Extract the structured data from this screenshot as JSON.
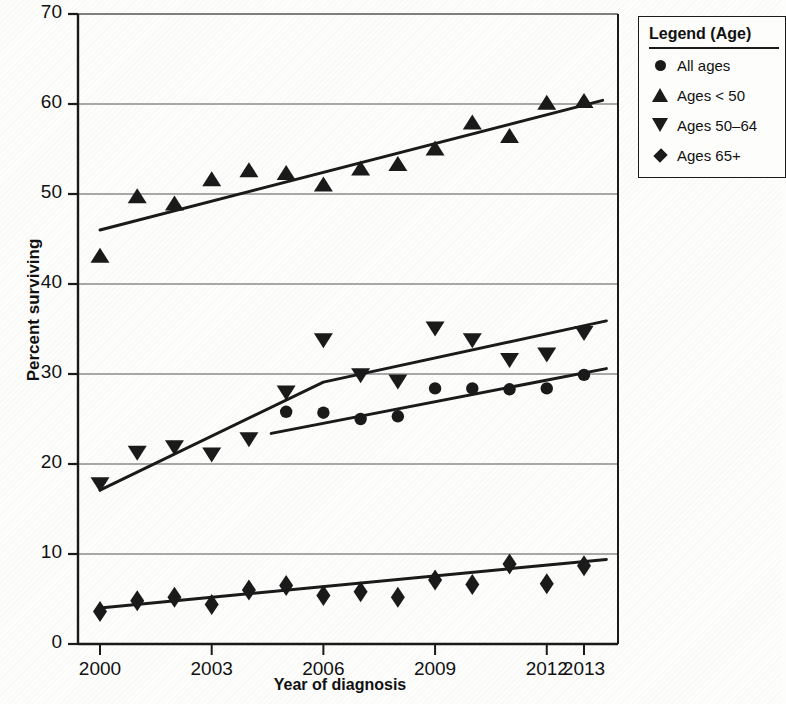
{
  "chart_data": {
    "type": "scatter",
    "title": "",
    "xlabel": "Year of diagnosis",
    "ylabel": "Percent surviving",
    "xlim": [
      1999.6,
      2013.8
    ],
    "ylim": [
      0,
      70
    ],
    "yticks": [
      0,
      10,
      20,
      30,
      40,
      50,
      60,
      70
    ],
    "xticks": [
      2000,
      2003,
      2006,
      2009,
      2012,
      2013
    ],
    "grid": "horizontal",
    "legend_position": "top-right",
    "legend_title": "Legend (Age)",
    "x": [
      2000,
      2001,
      2002,
      2003,
      2004,
      2005,
      2006,
      2007,
      2008,
      2009,
      2010,
      2011,
      2012,
      2013
    ],
    "series": [
      {
        "name": "All ages",
        "marker": "circle",
        "color": "#1a1a1a",
        "x": [
          2005,
          2006,
          2007,
          2008,
          2009,
          2010,
          2011,
          2012,
          2013
        ],
        "values": [
          25.8,
          25.7,
          25.0,
          25.3,
          28.4,
          28.4,
          28.3,
          28.4,
          29.9
        ],
        "trend": {
          "x": [
            2004.6,
            2013.6
          ],
          "y": [
            23.4,
            30.6
          ]
        }
      },
      {
        "name": "Ages < 50",
        "marker": "triangle-up",
        "color": "#1a1a1a",
        "x": [
          2000,
          2001,
          2002,
          2003,
          2004,
          2005,
          2006,
          2007,
          2008,
          2009,
          2010,
          2011,
          2012,
          2013
        ],
        "values": [
          43.0,
          49.6,
          48.8,
          51.5,
          52.5,
          52.2,
          50.9,
          52.7,
          53.2,
          54.9,
          57.8,
          56.3,
          60.0,
          60.2
        ],
        "trend": {
          "x": [
            2000.0,
            2013.5
          ],
          "y": [
            46.0,
            60.4
          ]
        }
      },
      {
        "name": "Ages 50–64",
        "marker": "triangle-down",
        "color": "#1a1a1a",
        "x": [
          2000,
          2001,
          2002,
          2003,
          2004,
          2005,
          2006,
          2007,
          2008,
          2009,
          2010,
          2011,
          2012,
          2013
        ],
        "values": [
          17.9,
          21.4,
          22.0,
          21.2,
          22.9,
          28.1,
          33.9,
          30.0,
          29.3,
          35.2,
          33.9,
          31.7,
          32.3,
          34.7
        ],
        "trend": {
          "x": [
            2000.0,
            2006.0,
            2013.6
          ],
          "y": [
            17.1,
            29.1,
            35.9
          ]
        }
      },
      {
        "name": "Ages 65+",
        "marker": "diamond",
        "color": "#1a1a1a",
        "x": [
          2000,
          2001,
          2002,
          2003,
          2004,
          2005,
          2006,
          2007,
          2008,
          2009,
          2010,
          2011,
          2012,
          2013
        ],
        "values": [
          3.6,
          4.8,
          5.2,
          4.4,
          6.0,
          6.5,
          5.4,
          5.8,
          5.2,
          7.1,
          6.6,
          8.9,
          6.7,
          8.7
        ],
        "trend": {
          "x": [
            2000.0,
            2013.6
          ],
          "y": [
            4.0,
            9.4
          ]
        }
      }
    ]
  },
  "axis": {
    "y_title": "Percent surviving",
    "x_title": "Year of diagnosis",
    "y_ticks": [
      "0",
      "10",
      "20",
      "30",
      "40",
      "50",
      "60",
      "70"
    ],
    "x_ticks": [
      "2000",
      "2003",
      "2006",
      "2009",
      "2012",
      "2013"
    ]
  },
  "legend": {
    "title": "Legend (Age)",
    "items": [
      {
        "label": "All ages",
        "marker": "circle-marker"
      },
      {
        "label": "Ages < 50",
        "marker": "triangle-up-marker"
      },
      {
        "label": "Ages 50–64",
        "marker": "triangle-down-marker"
      },
      {
        "label": "Ages 65+",
        "marker": "diamond-marker"
      }
    ]
  }
}
